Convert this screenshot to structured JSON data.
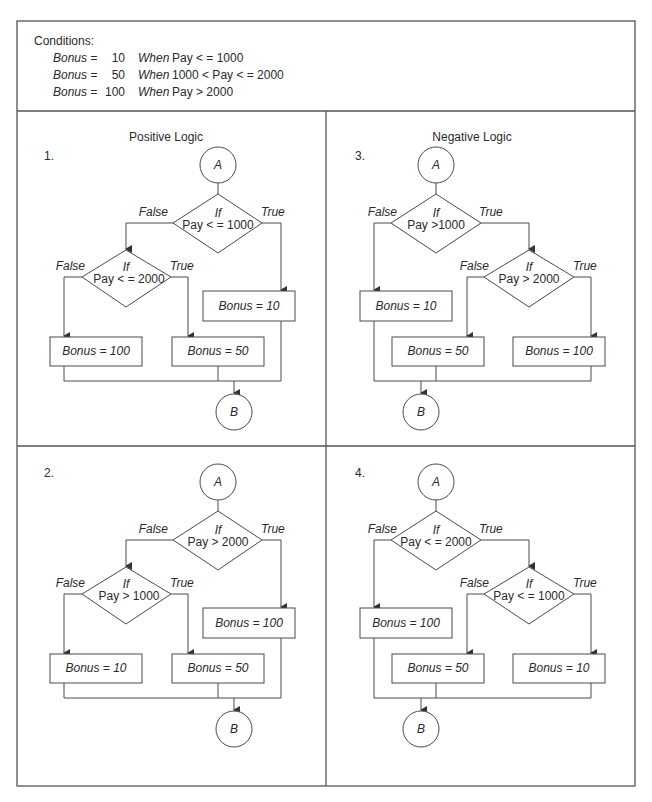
{
  "conditions": {
    "heading": "Conditions:",
    "rows": [
      {
        "label": "Bonus =",
        "value": "10",
        "when": "When",
        "rule": "Pay < = 1000"
      },
      {
        "label": "Bonus =",
        "value": "50",
        "when": "When",
        "rule": "1000 < Pay < = 2000"
      },
      {
        "label": "Bonus =",
        "value": "100",
        "when": "When",
        "rule": "Pay > 2000"
      }
    ]
  },
  "panels": {
    "p1": {
      "title": "Positive Logic",
      "number": "1.",
      "start": "A",
      "end": "B",
      "d1": {
        "if": "If",
        "cond": "Pay < = 1000",
        "false": "False",
        "true": "True"
      },
      "d2": {
        "if": "If",
        "cond": "Pay < = 2000",
        "false": "False",
        "true": "True"
      },
      "box_top": "Bonus = 10",
      "box_left": "Bonus = 100",
      "box_right": "Bonus = 50"
    },
    "p2": {
      "number": "2.",
      "start": "A",
      "end": "B",
      "d1": {
        "if": "If",
        "cond": "Pay > 2000",
        "false": "False",
        "true": "True"
      },
      "d2": {
        "if": "If",
        "cond": "Pay > 1000",
        "false": "False",
        "true": "True"
      },
      "box_top": "Bonus = 100",
      "box_left": "Bonus = 10",
      "box_right": "Bonus = 50"
    },
    "p3": {
      "title": "Negative Logic",
      "number": "3.",
      "start": "A",
      "end": "B",
      "d1": {
        "if": "If",
        "cond": "Pay >1000",
        "false": "False",
        "true": "True"
      },
      "d2": {
        "if": "If",
        "cond": "Pay > 2000",
        "false": "False",
        "true": "True"
      },
      "box_top": "Bonus = 10",
      "box_left": "Bonus = 50",
      "box_right": "Bonus = 100"
    },
    "p4": {
      "number": "4.",
      "start": "A",
      "end": "B",
      "d1": {
        "if": "If",
        "cond": "Pay < = 2000",
        "false": "False",
        "true": "True"
      },
      "d2": {
        "if": "If",
        "cond": "Pay < = 1000",
        "false": "False",
        "true": "True"
      },
      "box_top": "Bonus = 100",
      "box_left": "Bonus = 50",
      "box_right": "Bonus = 10"
    }
  }
}
